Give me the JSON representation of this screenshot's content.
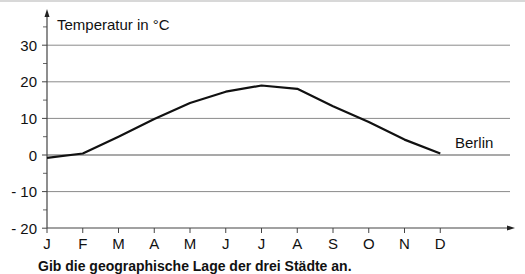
{
  "chart_data": {
    "type": "line",
    "title": "",
    "ylabel": "Temperatur in °C",
    "xlabel": "",
    "categories": [
      "J",
      "F",
      "M",
      "A",
      "M",
      "J",
      "J",
      "A",
      "S",
      "O",
      "N",
      "D"
    ],
    "series": [
      {
        "name": "Berlin",
        "values": [
          -0.8,
          0.4,
          5.0,
          9.8,
          14.2,
          17.3,
          19.0,
          18.1,
          13.3,
          9.0,
          4.2,
          0.4
        ]
      }
    ],
    "ylim": [
      -20,
      35
    ],
    "yticks": [
      30,
      20,
      10,
      0,
      -10,
      -20
    ],
    "ytick_labels": [
      "30",
      "20",
      "10",
      "0",
      "- 10",
      "- 20"
    ],
    "minor_ytick_step": 5,
    "grid": true,
    "legend": "inline label at line end"
  },
  "labels": {
    "axis_title": "Temperatur in °C",
    "series_label": "Berlin",
    "caption": "Gib die geographische Lage der drei Städte an."
  },
  "colors": {
    "line": "#111111",
    "grid": "#8a8a8a",
    "axis": "#444444"
  }
}
